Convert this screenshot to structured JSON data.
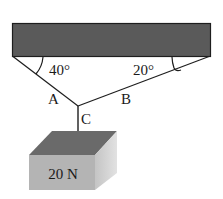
{
  "diagram": {
    "type": "static-equilibrium",
    "ceiling": {
      "fill": "#5a5a5a",
      "stroke": "#1e1e1e"
    },
    "ropes": [
      {
        "id": "A",
        "label": "A",
        "angle_label": "40°",
        "angle_deg": 40
      },
      {
        "id": "B",
        "label": "B",
        "angle_label": "20°",
        "angle_deg": 20
      },
      {
        "id": "C",
        "label": "C"
      }
    ],
    "block": {
      "label": "20 N",
      "colors": {
        "top": "#6a6a6a",
        "front": "#b4b4b4",
        "side": "#d2d2d2"
      }
    }
  }
}
